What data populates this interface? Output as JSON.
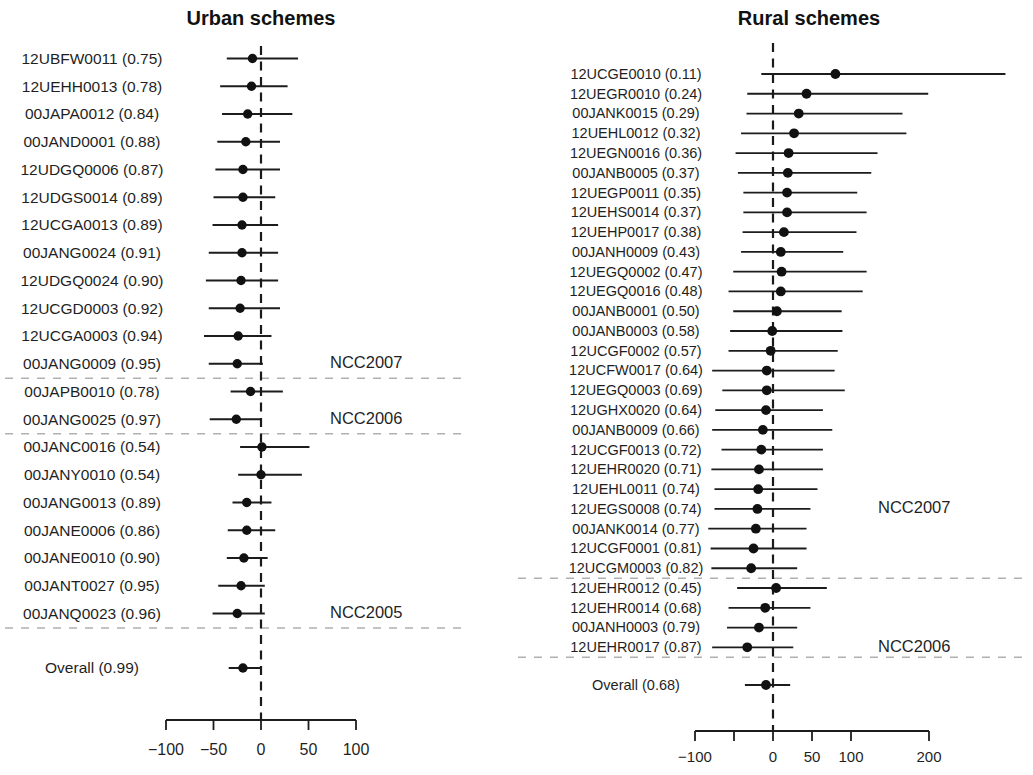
{
  "colors": {
    "marker": "#111111",
    "ci_line": "#1c1c1c",
    "zero_line": "#1a1a1a",
    "separator": "#b0b0b0",
    "text": "#1f1f1f",
    "background": "#ffffff"
  },
  "chart_data": [
    {
      "type": "scatter",
      "subtype": "forest-plot",
      "title": "Urban schemes",
      "xlabel": "",
      "xlim": [
        -100,
        100
      ],
      "x_ticks": [
        -100,
        -50,
        0,
        50,
        100
      ],
      "x_tick_labels": [
        "−100",
        "−50",
        "0",
        "50",
        "100"
      ],
      "zero_reference": 0,
      "rows": [
        {
          "label": "12UBFW0011 (0.75)",
          "estimate": -9,
          "ci_low": -36,
          "ci_high": 39
        },
        {
          "label": "12UEHH0013 (0.78)",
          "estimate": -10,
          "ci_low": -43,
          "ci_high": 28
        },
        {
          "label": "00JAPA0012 (0.84)",
          "estimate": -14,
          "ci_low": -41,
          "ci_high": 33
        },
        {
          "label": "00JAND0001 (0.88)",
          "estimate": -16,
          "ci_low": -46,
          "ci_high": 20
        },
        {
          "label": "12UDGQ0006 (0.87)",
          "estimate": -19,
          "ci_low": -48,
          "ci_high": 20
        },
        {
          "label": "12UDGS0014 (0.89)",
          "estimate": -19,
          "ci_low": -50,
          "ci_high": 15
        },
        {
          "label": "12UCGA0013 (0.89)",
          "estimate": -20,
          "ci_low": -51,
          "ci_high": 18
        },
        {
          "label": "00JANG0024 (0.91)",
          "estimate": -20,
          "ci_low": -55,
          "ci_high": 18
        },
        {
          "label": "12UDGQ0024 (0.90)",
          "estimate": -21,
          "ci_low": -58,
          "ci_high": 18
        },
        {
          "label": "12UCGD0003 (0.92)",
          "estimate": -22,
          "ci_low": -55,
          "ci_high": 20
        },
        {
          "label": "12UCGA0003 (0.94)",
          "estimate": -24,
          "ci_low": -60,
          "ci_high": 11
        },
        {
          "label": "00JANG0009 (0.95)",
          "estimate": -25,
          "ci_low": -55,
          "ci_high": 2
        },
        {
          "label": "00JAPB0010 (0.78)",
          "estimate": -11,
          "ci_low": -32,
          "ci_high": 23
        },
        {
          "label": "00JANG0025 (0.97)",
          "estimate": -26,
          "ci_low": -54,
          "ci_high": 1
        },
        {
          "label": "00JANC0016 (0.54)",
          "estimate": 1,
          "ci_low": -22,
          "ci_high": 51
        },
        {
          "label": "00JANY0010 (0.54)",
          "estimate": 0,
          "ci_low": -24,
          "ci_high": 43
        },
        {
          "label": "00JANG0013 (0.89)",
          "estimate": -15,
          "ci_low": -30,
          "ci_high": 11
        },
        {
          "label": "00JANE0006 (0.86)",
          "estimate": -15,
          "ci_low": -35,
          "ci_high": 15
        },
        {
          "label": "00JANE0010 (0.90)",
          "estimate": -18,
          "ci_low": -36,
          "ci_high": 7
        },
        {
          "label": "00JANT0027 (0.95)",
          "estimate": -21,
          "ci_low": -45,
          "ci_high": 4
        },
        {
          "label": "00JANQ0023 (0.96)",
          "estimate": -25,
          "ci_low": -51,
          "ci_high": 4
        }
      ],
      "groups": [
        {
          "name": "NCC2007",
          "label_row": 11,
          "separator_after_row": 11
        },
        {
          "name": "NCC2006",
          "label_row": 13,
          "separator_after_row": 13
        },
        {
          "name": "NCC2005",
          "label_row": 20,
          "separator_after_row": 20
        }
      ],
      "overall": {
        "label": "Overall (0.99)",
        "estimate": -19,
        "ci_low": -34,
        "ci_high": 0
      }
    },
    {
      "type": "scatter",
      "subtype": "forest-plot",
      "title": "Rural schemes",
      "xlabel": "",
      "xlim": [
        -100,
        200
      ],
      "x_ticks": [
        -100,
        -50,
        0,
        50,
        100,
        200
      ],
      "x_tick_labels": [
        "−100",
        "",
        "0",
        "50",
        "100",
        "200"
      ],
      "zero_reference": 0,
      "rows": [
        {
          "label": "12UCGE0010 (0.11)",
          "estimate": 80,
          "ci_low": -15,
          "ci_high": 298
        },
        {
          "label": "12UEGR0010 (0.24)",
          "estimate": 43,
          "ci_low": -33,
          "ci_high": 199
        },
        {
          "label": "00JANK0015 (0.29)",
          "estimate": 33,
          "ci_low": -34,
          "ci_high": 166
        },
        {
          "label": "12UEHL0012 (0.32)",
          "estimate": 27,
          "ci_low": -41,
          "ci_high": 171
        },
        {
          "label": "12UEGN0016 (0.36)",
          "estimate": 20,
          "ci_low": -48,
          "ci_high": 134
        },
        {
          "label": "00JANB0005 (0.37)",
          "estimate": 19,
          "ci_low": -45,
          "ci_high": 126
        },
        {
          "label": "12UEGP0011 (0.35)",
          "estimate": 18,
          "ci_low": -38,
          "ci_high": 108
        },
        {
          "label": "12UEHS0014 (0.37)",
          "estimate": 18,
          "ci_low": -38,
          "ci_high": 120
        },
        {
          "label": "12UEHP0017 (0.38)",
          "estimate": 14,
          "ci_low": -39,
          "ci_high": 107
        },
        {
          "label": "00JANH0009 (0.43)",
          "estimate": 10,
          "ci_low": -41,
          "ci_high": 90
        },
        {
          "label": "12UEGQ0002 (0.47)",
          "estimate": 11,
          "ci_low": -51,
          "ci_high": 120
        },
        {
          "label": "12UEGQ0016 (0.48)",
          "estimate": 10,
          "ci_low": -57,
          "ci_high": 115
        },
        {
          "label": "00JANB0001 (0.50)",
          "estimate": 5,
          "ci_low": -51,
          "ci_high": 88
        },
        {
          "label": "00JANB0003 (0.58)",
          "estimate": -1,
          "ci_low": -55,
          "ci_high": 89
        },
        {
          "label": "12UCGF0002 (0.57)",
          "estimate": -3,
          "ci_low": -57,
          "ci_high": 83
        },
        {
          "label": "12UCFW0017 (0.64)",
          "estimate": -8,
          "ci_low": -78,
          "ci_high": 79
        },
        {
          "label": "12UEGQ0003 (0.69)",
          "estimate": -8,
          "ci_low": -65,
          "ci_high": 92
        },
        {
          "label": "12UGHX0020 (0.64)",
          "estimate": -9,
          "ci_low": -74,
          "ci_high": 64
        },
        {
          "label": "00JANB0009 (0.66)",
          "estimate": -13,
          "ci_low": -78,
          "ci_high": 76
        },
        {
          "label": "12UCGF0013 (0.72)",
          "estimate": -15,
          "ci_low": -66,
          "ci_high": 64
        },
        {
          "label": "12UEHR0020 (0.71)",
          "estimate": -18,
          "ci_low": -79,
          "ci_high": 64
        },
        {
          "label": "12UEHL0011 (0.74)",
          "estimate": -19,
          "ci_low": -75,
          "ci_high": 57
        },
        {
          "label": "12UEGS0008 (0.74)",
          "estimate": -20,
          "ci_low": -75,
          "ci_high": 48
        },
        {
          "label": "00JANK0014 (0.77)",
          "estimate": -22,
          "ci_low": -83,
          "ci_high": 43
        },
        {
          "label": "12UCGF0001 (0.81)",
          "estimate": -25,
          "ci_low": -80,
          "ci_high": 43
        },
        {
          "label": "12UCGM0003 (0.82)",
          "estimate": -28,
          "ci_low": -79,
          "ci_high": 31
        },
        {
          "label": "12UEHR0012 (0.45)",
          "estimate": 4,
          "ci_low": -46,
          "ci_high": 69
        },
        {
          "label": "12UEHR0014 (0.68)",
          "estimate": -10,
          "ci_low": -57,
          "ci_high": 48
        },
        {
          "label": "00JANH0003 (0.79)",
          "estimate": -18,
          "ci_low": -59,
          "ci_high": 31
        },
        {
          "label": "12UEHR0017 (0.87)",
          "estimate": -33,
          "ci_low": -78,
          "ci_high": 26
        }
      ],
      "groups": [
        {
          "name": "NCC2007",
          "label_row": 22,
          "separator_after_row": 25
        },
        {
          "name": "NCC2006",
          "label_row": 29,
          "separator_after_row": 29
        }
      ],
      "overall": {
        "label": "Overall (0.68)",
        "estimate": -9,
        "ci_low": -36,
        "ci_high": 22
      }
    }
  ]
}
